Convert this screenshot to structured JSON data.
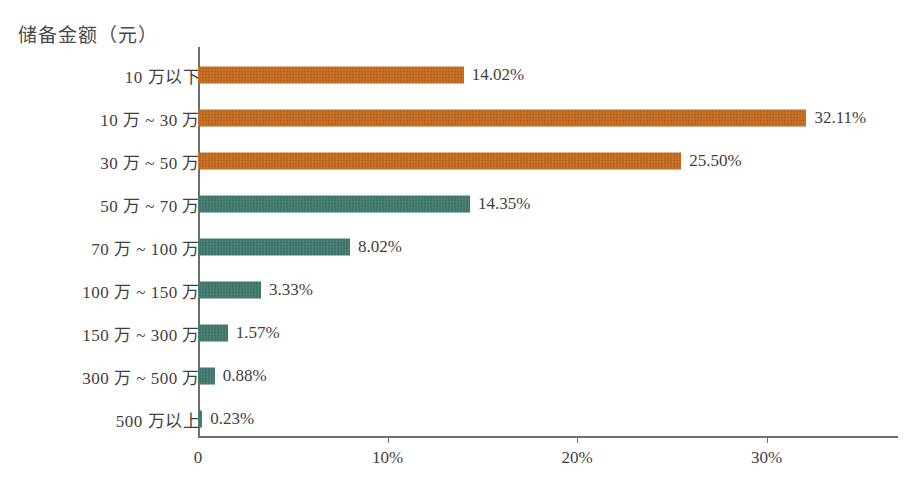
{
  "chart_data": {
    "type": "bar",
    "orientation": "horizontal",
    "title": "储备金额（元）",
    "xlabel": "",
    "ylabel": "储备金额（元）",
    "categories": [
      "10 万以下",
      "10 万 ~ 30 万",
      "30 万 ~ 50 万",
      "50 万 ~ 70 万",
      "70 万 ~ 100 万",
      "100 万 ~ 150 万",
      "150 万 ~ 300 万",
      "300 万 ~ 500 万",
      "500 万以上"
    ],
    "values": [
      14.02,
      32.11,
      25.5,
      14.35,
      8.02,
      3.33,
      1.57,
      0.88,
      0.23
    ],
    "value_labels": [
      "14.02%",
      "32.11%",
      "25.50%",
      "14.35%",
      "8.02%",
      "3.33%",
      "1.57%",
      "0.88%",
      "0.23%"
    ],
    "bar_colors": [
      "#c3691e",
      "#c3691e",
      "#c3691e",
      "#40786e",
      "#40786e",
      "#40786e",
      "#40786e",
      "#40786e",
      "#40786e"
    ],
    "colors": {
      "orange": "#c3691e",
      "teal": "#40786e",
      "axis": "#6e6e6e",
      "text": "#3f3f3f",
      "background": "#ffffff"
    },
    "xlim": [
      0,
      35.5
    ],
    "xticks": [
      0,
      10,
      20,
      30
    ],
    "xtick_labels": [
      "0",
      "10%",
      "20%",
      "30%"
    ],
    "grid": false,
    "legend": false
  }
}
